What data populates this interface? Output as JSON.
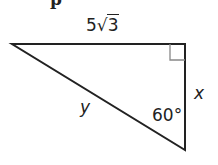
{
  "figure": {
    "type": "right-triangle",
    "cut_off_text": "p",
    "labels": {
      "top_side_coefficient": "5",
      "top_side_radical_sign": "√",
      "top_side_radicand": "3",
      "right_side": "x",
      "hypotenuse": "y",
      "angle": "60°"
    },
    "vertices": {
      "left": [
        12,
        44
      ],
      "top_right": [
        185,
        44
      ],
      "bottom_right": [
        185,
        150
      ]
    },
    "right_angle_marker": {
      "at": "top_right",
      "size": 15
    },
    "colors": {
      "stroke": "#222222",
      "marker": "#888888",
      "background": "#ffffff"
    }
  }
}
